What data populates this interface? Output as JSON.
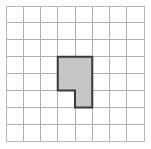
{
  "figure": {
    "background_color": "#ffffff"
  },
  "grid": {
    "columns": 8,
    "rows": 8,
    "origin_x": 6,
    "origin_y": 6,
    "cell_width": 17.25,
    "cell_height": 16.9,
    "line_color": "#b0b0b0",
    "line_width": 1,
    "border_color": "#b8b8b8",
    "border_width": 1
  },
  "shape": {
    "name": "p-shape-polygon",
    "fill_color": "#c6c6c6",
    "stroke_color": "#3a3a3a",
    "stroke_width": 2,
    "cells_covered": 5,
    "grid_cells": [
      {
        "col": 3,
        "row": 3
      },
      {
        "col": 4,
        "row": 3
      },
      {
        "col": 3,
        "row": 4
      },
      {
        "col": 4,
        "row": 4
      },
      {
        "col": 4,
        "row": 5
      }
    ],
    "vertices_grid": [
      {
        "col": 3,
        "row": 3
      },
      {
        "col": 5,
        "row": 3
      },
      {
        "col": 5,
        "row": 6
      },
      {
        "col": 4,
        "row": 6
      },
      {
        "col": 4,
        "row": 5
      },
      {
        "col": 3,
        "row": 5
      }
    ],
    "vertices_px": [
      {
        "x": 57.75,
        "y": 56.7
      },
      {
        "x": 92.25,
        "y": 56.7
      },
      {
        "x": 92.25,
        "y": 107.4
      },
      {
        "x": 75.0,
        "y": 107.4
      },
      {
        "x": 75.0,
        "y": 90.5
      },
      {
        "x": 57.75,
        "y": 90.5
      }
    ]
  }
}
